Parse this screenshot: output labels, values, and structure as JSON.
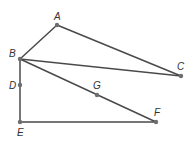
{
  "diagram": {
    "type": "geometry-figure",
    "points": [
      {
        "name": "A",
        "x": 57,
        "y": 25,
        "label_dx": -3,
        "label_dy": -5
      },
      {
        "name": "B",
        "x": 20,
        "y": 59,
        "label_dx": -11,
        "label_dy": -2
      },
      {
        "name": "C",
        "x": 181,
        "y": 76,
        "label_dx": -4,
        "label_dy": -6
      },
      {
        "name": "D",
        "x": 20,
        "y": 85,
        "label_dx": -11,
        "label_dy": 4
      },
      {
        "name": "E",
        "x": 20,
        "y": 122,
        "label_dx": -3,
        "label_dy": 14
      },
      {
        "name": "F",
        "x": 156,
        "y": 122,
        "label_dx": -2,
        "label_dy": -6
      },
      {
        "name": "G",
        "x": 97,
        "y": 95,
        "label_dx": -4,
        "label_dy": -6
      }
    ],
    "segments": [
      [
        "A",
        "B"
      ],
      [
        "A",
        "C"
      ],
      [
        "B",
        "C"
      ],
      [
        "B",
        "F"
      ],
      [
        "B",
        "E"
      ],
      [
        "E",
        "F"
      ]
    ],
    "colors": {
      "line": "#4a4a4a",
      "point": "#6e6e6e",
      "label": "#333333"
    }
  }
}
